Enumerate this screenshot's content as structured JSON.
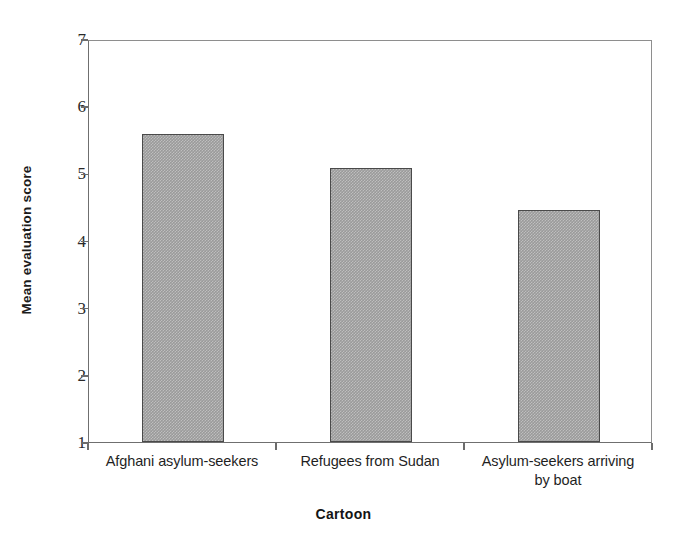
{
  "chart_data": {
    "type": "bar",
    "title": "",
    "xlabel": "Cartoon",
    "ylabel": "Mean evaluation score",
    "categories": [
      "Afghani asylum-seekers",
      "Refugees from Sudan",
      "Asylum-seekers arriving by boat"
    ],
    "category_lines": [
      [
        "Afghani asylum-seekers"
      ],
      [
        "Refugees from Sudan"
      ],
      [
        "Asylum-seekers arriving",
        "by boat"
      ]
    ],
    "values": [
      5.58,
      5.08,
      4.45
    ],
    "ylim": [
      1,
      7
    ],
    "yticks": [
      1,
      2,
      3,
      4,
      5,
      6,
      7
    ],
    "ytick_labels": [
      "1",
      "2",
      "3",
      "4",
      "5",
      "6",
      "7"
    ],
    "grid": false,
    "legend": false,
    "bar_fill_color": "#9a9a9a",
    "bar_edge_color": "#4a4a4a",
    "axis_color": "#6c6c6c",
    "background_color": "#ffffff"
  }
}
